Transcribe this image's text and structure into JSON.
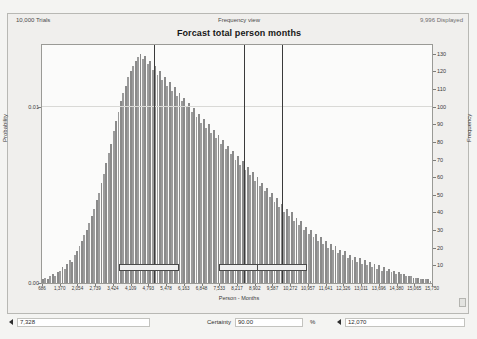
{
  "window": {
    "header_left": "10,000 Trials",
    "header_center": "Frequency view",
    "header_right": "9,996 Displayed",
    "title": "Forcast total person months"
  },
  "controls": {
    "lower_bound": "7,328",
    "certainty_label": "Certainty",
    "certainty_value": "90.00",
    "percent_symbol": "%",
    "upper_bound": "12,070",
    "left_arrow_icon": "triangle-right-icon",
    "right_arrow_icon": "triangle-left-icon"
  },
  "chart_data": {
    "type": "bar",
    "title": "Forcast total person months",
    "subtitle": "Frequency view",
    "xlabel": "Person - Months",
    "ylabel": "Probability",
    "ylabel_right": "Frequency",
    "grid": true,
    "legend": "none",
    "trials": 10000,
    "displayed": 9996,
    "certainty_percent": 90.0,
    "certainty_lower": 7328,
    "certainty_upper": 12070,
    "xlim": [
      686,
      15750
    ],
    "ylim_probability": [
      0.0,
      0.013
    ],
    "ylim_frequency": [
      0,
      130
    ],
    "ytick_labels_left": [
      "0.01",
      "0.00"
    ],
    "ytick_labels_right": [
      "130",
      "120",
      "110",
      "100",
      "90",
      "80",
      "70",
      "60",
      "50",
      "40",
      "30",
      "20",
      "10"
    ],
    "xtick_labels": [
      "686",
      "1,370",
      "2,054",
      "2,739",
      "3,424",
      "4,109",
      "4,793",
      "5,478",
      "6,163",
      "6,848",
      "7,533",
      "8,217",
      "8,902",
      "9,587",
      "10,272",
      "10,957",
      "11,641",
      "12,326",
      "13,011",
      "13,696",
      "14,380",
      "15,065",
      "15,750"
    ],
    "bin_count": 160,
    "values": [
      2,
      3,
      2,
      4,
      5,
      4,
      6,
      7,
      9,
      8,
      11,
      13,
      12,
      16,
      18,
      21,
      24,
      27,
      30,
      34,
      38,
      42,
      47,
      51,
      57,
      62,
      68,
      74,
      79,
      86,
      92,
      97,
      103,
      108,
      112,
      117,
      120,
      123,
      126,
      128,
      130,
      127,
      129,
      124,
      126,
      121,
      123,
      118,
      120,
      115,
      117,
      112,
      114,
      109,
      111,
      106,
      108,
      103,
      105,
      100,
      102,
      97,
      99,
      94,
      96,
      91,
      93,
      88,
      90,
      85,
      87,
      82,
      84,
      79,
      81,
      76,
      78,
      73,
      75,
      70,
      72,
      67,
      69,
      64,
      66,
      61,
      63,
      58,
      60,
      55,
      57,
      52,
      54,
      49,
      51,
      46,
      48,
      43,
      45,
      40,
      42,
      38,
      40,
      35,
      37,
      33,
      35,
      30,
      32,
      28,
      30,
      26,
      28,
      24,
      26,
      22,
      24,
      20,
      22,
      19,
      21,
      17,
      19,
      16,
      18,
      14,
      16,
      13,
      15,
      12,
      14,
      11,
      13,
      10,
      12,
      9,
      11,
      8,
      10,
      7,
      9,
      7,
      8,
      6,
      7,
      5,
      6,
      5,
      5,
      4,
      4,
      4,
      3,
      3,
      3,
      2,
      2,
      2,
      2,
      1
    ]
  }
}
